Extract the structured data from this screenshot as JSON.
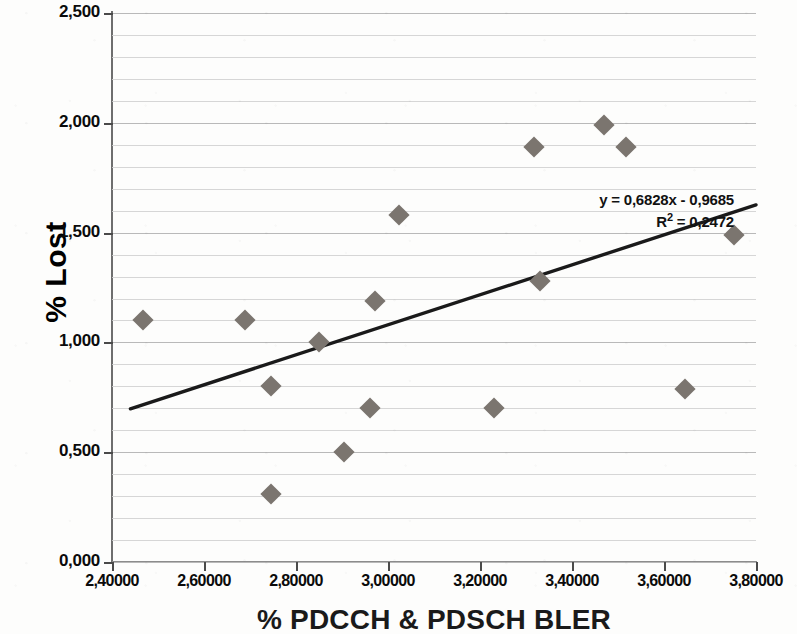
{
  "chart_data": {
    "type": "scatter",
    "title": "",
    "xlabel": "% PDCCH & PDSCH BLER",
    "ylabel": "% Lost",
    "xlim": [
      2.4,
      3.8
    ],
    "ylim": [
      0.0,
      2.5
    ],
    "grid": true,
    "legend": "none",
    "x_tick_labels": [
      "2,40000",
      "2,60000",
      "2,80000",
      "3,00000",
      "3,20000",
      "3,40000",
      "3,60000",
      "3,80000"
    ],
    "x_tick_values": [
      2.4,
      2.6,
      2.8,
      3.0,
      3.2,
      3.4,
      3.6,
      3.8
    ],
    "y_tick_labels": [
      "0,000",
      "0,500",
      "1,000",
      "1,500",
      "2,000",
      "2,500"
    ],
    "y_tick_values": [
      0.0,
      0.5,
      1.0,
      1.5,
      2.0,
      2.5
    ],
    "minor_gridline_step": 0.1,
    "marker_color": "#7b756f",
    "marker_shape": "diamond",
    "trendline_color": "#1a1a1a",
    "points": [
      {
        "x": 2.467,
        "y": 1.1
      },
      {
        "x": 2.69,
        "y": 1.1
      },
      {
        "x": 2.745,
        "y": 0.8
      },
      {
        "x": 2.745,
        "y": 0.31
      },
      {
        "x": 2.85,
        "y": 1.0
      },
      {
        "x": 2.905,
        "y": 0.5
      },
      {
        "x": 2.96,
        "y": 0.7
      },
      {
        "x": 2.972,
        "y": 1.19
      },
      {
        "x": 3.023,
        "y": 1.58
      },
      {
        "x": 3.23,
        "y": 0.7
      },
      {
        "x": 3.318,
        "y": 1.89
      },
      {
        "x": 3.33,
        "y": 1.28
      },
      {
        "x": 3.47,
        "y": 1.99
      },
      {
        "x": 3.518,
        "y": 1.89
      },
      {
        "x": 3.645,
        "y": 0.79
      },
      {
        "x": 3.752,
        "y": 1.49
      }
    ],
    "trendline": {
      "slope": 0.6828,
      "intercept": -0.9685,
      "r_squared": 0.2472,
      "x_start": 2.44,
      "x_end": 3.8,
      "equation_line1": "y = 0,6828x - 0,9685",
      "equation_line2_prefix": "R",
      "equation_line2_sup": "2",
      "equation_line2_suffix": " = 0,2472"
    }
  }
}
